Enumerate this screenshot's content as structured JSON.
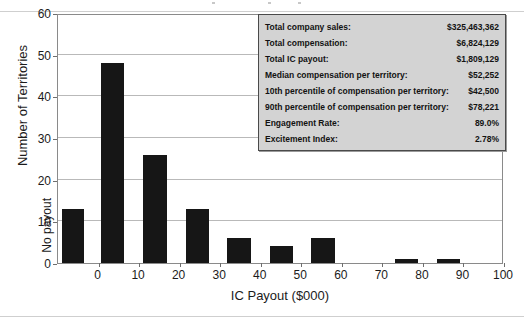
{
  "chart_data": {
    "type": "bar",
    "title": "",
    "xlabel": "IC Payout ($000)",
    "ylabel": "Number of Territories",
    "ylim": [
      0,
      60
    ],
    "ytick_step": 10,
    "yticks": [
      0,
      10,
      20,
      30,
      40,
      50,
      60
    ],
    "xlim": [
      -10,
      100
    ],
    "xticks": [
      "0",
      "10",
      "20",
      "30",
      "40",
      "50",
      "60",
      "70",
      "80",
      "90",
      "100"
    ],
    "xtick_values": [
      0,
      10,
      20,
      30,
      40,
      50,
      60,
      70,
      80,
      90,
      100
    ],
    "special_category_label": "No payout",
    "grid": "horizontal",
    "legend": "none",
    "bar_color": "#161616",
    "categories": [
      "No payout",
      "0-10",
      "10-20",
      "20-30",
      "30-40",
      "40-50",
      "50-60",
      "60-70",
      "70-80",
      "80-90",
      "90-100"
    ],
    "values": [
      13,
      48,
      26,
      13,
      6,
      4,
      6,
      0,
      1,
      1,
      0
    ],
    "bars": [
      {
        "label": "No payout",
        "value": 13,
        "x_start": -9.0,
        "x_end": -3.5
      },
      {
        "label": "0-10",
        "value": 48,
        "x_start": 0.6,
        "x_end": 6.4
      },
      {
        "label": "10-20",
        "value": 26,
        "x_start": 11.0,
        "x_end": 16.8
      },
      {
        "label": "20-30",
        "value": 13,
        "x_start": 21.5,
        "x_end": 27.2
      },
      {
        "label": "30-40",
        "value": 6,
        "x_start": 31.8,
        "x_end": 37.5
      },
      {
        "label": "40-50",
        "value": 4,
        "x_start": 42.2,
        "x_end": 47.9
      },
      {
        "label": "50-60",
        "value": 6,
        "x_start": 52.5,
        "x_end": 58.2
      },
      {
        "label": "70-80",
        "value": 1,
        "x_start": 73.2,
        "x_end": 78.9
      },
      {
        "label": "80-90",
        "value": 1,
        "x_start": 83.5,
        "x_end": 89.2
      }
    ]
  },
  "stats_box": {
    "rows": [
      {
        "label": "Total company sales:",
        "value": "$325,463,362"
      },
      {
        "label": "Total compensation:",
        "value": "$6,824,129"
      },
      {
        "label": "Total IC payout:",
        "value": "$1,809,129"
      },
      {
        "label": "Median compensation per territory:",
        "value": "$52,252"
      },
      {
        "label": "10th percentile of compensation per territory:",
        "value": "$42,500"
      },
      {
        "label": "90th percentile of compensation per territory:",
        "value": "$78,221"
      },
      {
        "label": "Engagement Rate:",
        "value": "89.0%"
      },
      {
        "label": "Excitement Index:",
        "value": "2.78%"
      }
    ]
  },
  "colors": {
    "bar": "#161616",
    "gridline": "#b9b9b9",
    "frame": "#8a8a8a",
    "stats_background": "#d3d3d3",
    "stats_border": "#4a4a4a",
    "text": "#1b1b1b"
  }
}
